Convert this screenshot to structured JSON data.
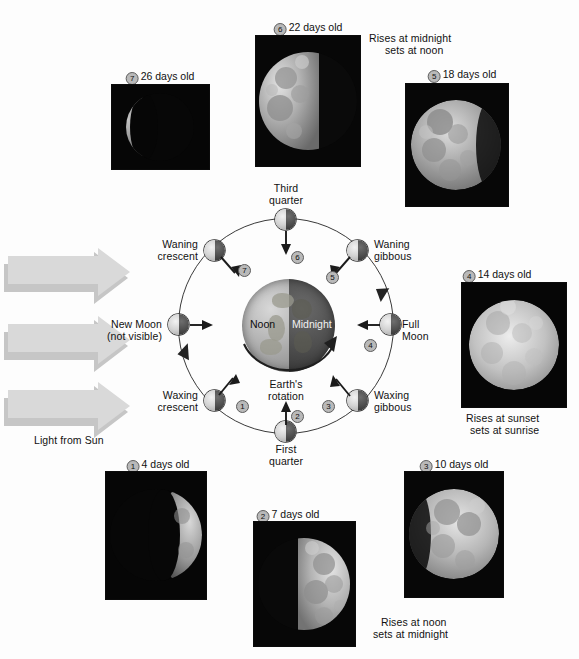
{
  "figure": {
    "background_color": "#fdfdfd",
    "text_color": "#111111"
  },
  "sun": {
    "light_label": "Light from Sun",
    "arrow_color": "#d4d4d4",
    "arrow_shadow_color": "#c2c2c2",
    "arrow_count": 3
  },
  "earth": {
    "day_label": "Noon",
    "night_label": "Midnight",
    "rotation_label_line1": "Earth's",
    "rotation_label_line2": "rotation",
    "day_color": "#b4b4b4",
    "night_color": "#4e4e4e"
  },
  "orbit": {
    "center_x": 285,
    "center_y": 325,
    "radius": 107,
    "stroke_color": "#3a3a3a"
  },
  "phases": [
    {
      "number": "1",
      "orbit_label_line1": "Waxing",
      "orbit_label_line2": "crescent",
      "caption": "4 days old",
      "caption_full": "① 4 days old",
      "angle_deg": 225,
      "rise_set": null
    },
    {
      "number": "2",
      "orbit_label_line1": "First",
      "orbit_label_line2": "quarter",
      "caption": "7 days old",
      "caption_full": "② 7 days old",
      "angle_deg": 270,
      "rise_set": [
        "Rises at noon",
        "sets at midnight"
      ]
    },
    {
      "number": "3",
      "orbit_label_line1": "Waxing",
      "orbit_label_line2": "gibbous",
      "caption": "10 days old",
      "caption_full": "③ 10 days old",
      "angle_deg": 315,
      "rise_set": null
    },
    {
      "number": "4",
      "orbit_label_line1": "Full",
      "orbit_label_line2": "Moon",
      "caption": "14 days old",
      "caption_full": "④ 14 days old",
      "angle_deg": 0,
      "rise_set": [
        "Rises at sunset",
        "sets at sunrise"
      ]
    },
    {
      "number": "5",
      "orbit_label_line1": "Waning",
      "orbit_label_line2": "gibbous",
      "caption": "18 days old",
      "caption_full": "⑤ 18 days old",
      "angle_deg": 45,
      "rise_set": null
    },
    {
      "number": "6",
      "orbit_label_line1": "Third",
      "orbit_label_line2": "quarter",
      "caption": "22 days old",
      "caption_full": "⑥ 22 days old",
      "angle_deg": 90,
      "rise_set": [
        "Rises at midnight",
        "sets at noon"
      ]
    },
    {
      "number": "7",
      "orbit_label_line1": "Waning",
      "orbit_label_line2": "crescent",
      "caption": "26 days old",
      "caption_full": "⑦ 26 days old",
      "angle_deg": 135,
      "rise_set": null
    },
    {
      "number": "",
      "orbit_label_line1": "New Moon",
      "orbit_label_line2": "(not visible)",
      "caption": null,
      "caption_full": null,
      "angle_deg": 180,
      "rise_set": null
    }
  ],
  "photos": [
    {
      "id": "photo-26-days",
      "label": "26 days old",
      "number": "7",
      "illum": 0.12,
      "dir": "left"
    },
    {
      "id": "photo-22-days",
      "label": "22 days old",
      "number": "6",
      "illum": 0.55,
      "dir": "left"
    },
    {
      "id": "photo-18-days",
      "label": "18 days old",
      "number": "5",
      "illum": 0.85,
      "dir": "left"
    },
    {
      "id": "photo-14-days",
      "label": "14 days old",
      "number": "4",
      "illum": 1.0,
      "dir": "full"
    },
    {
      "id": "photo-10-days",
      "label": "10 days old",
      "number": "3",
      "illum": 0.82,
      "dir": "right"
    },
    {
      "id": "photo-7-days",
      "label": "7 days old",
      "number": "2",
      "illum": 0.55,
      "dir": "right"
    },
    {
      "id": "photo-4-days",
      "label": "4 days old",
      "number": "1",
      "illum": 0.22,
      "dir": "right"
    }
  ],
  "notes": {
    "midnight_note_line1": "Rises at midnight",
    "midnight_note_line2": "sets at noon",
    "sunset_note_line1": "Rises at sunset",
    "sunset_note_line2": "sets at sunrise",
    "noon_note_line1": "Rises at noon",
    "noon_note_line2": "sets at midnight"
  }
}
